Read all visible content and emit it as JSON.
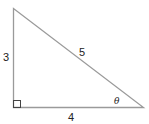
{
  "diagram": {
    "type": "right-triangle",
    "labels": {
      "vertical_leg": "3",
      "hypotenuse": "5",
      "horizontal_leg": "4",
      "angle": "θ"
    },
    "colors": {
      "stroke": "#9a9a9a",
      "text": "#222222"
    }
  }
}
